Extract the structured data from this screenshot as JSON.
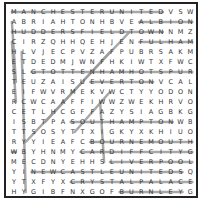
{
  "puzzle": {
    "rows": [
      "MANCHESTERUNITEDVSW",
      "ABRIAHTONHBVEALBION",
      "HUDDERSFIELDTOWNNMZ",
      "CIRZQHHQEHJENFULHAM",
      "HLVJECPVZAFPUBRSAKM",
      "ETDEDMJWNFHKIWTXFWC",
      "SLGTOTTENHAMHOTSPUR",
      "TEUZAISUEVERTONVCAL",
      "EIFWVRMEKVWCTYYODON",
      "RCWCAAFFIWWZWEKHRVO",
      "CETLHCGFFAZYSIAGBKG",
      "ISBTPASOUTHAMPTONWB",
      "TTSOSYTTXIGKYXKHIUO",
      "RYYIEAFCBOURNEMOUTH",
      "WBYHNMYCARDIFFCITYG",
      "MECDNYEHHSLIVERPOOL",
      "YINEWCASTLEUNITEDSQ",
      "YTXFYXCRYSTALPALACE",
      "HYGIBFNXGOFBURNLEYG"
    ],
    "found_words": [
      {
        "word": "MANCHESTER UNITED",
        "r1": 0,
        "c1": 0,
        "r2": 0,
        "c2": 15
      },
      {
        "word": "ALBION",
        "r1": 1,
        "c1": 13,
        "r2": 1,
        "c2": 18
      },
      {
        "word": "HUDDERSFIELD TOWN",
        "r1": 2,
        "c1": 0,
        "r2": 2,
        "c2": 15
      },
      {
        "word": "FULHAM",
        "r1": 3,
        "c1": 13,
        "r2": 3,
        "c2": 18
      },
      {
        "word": "TOTTENHAM HOTSPUR",
        "r1": 6,
        "c1": 2,
        "r2": 6,
        "c2": 18
      },
      {
        "word": "EVERTON",
        "r1": 7,
        "c1": 8,
        "r2": 7,
        "c2": 14
      },
      {
        "word": "SOUTHAMPTON",
        "r1": 11,
        "c1": 6,
        "r2": 11,
        "c2": 16
      },
      {
        "word": "BOURNEMOUTH",
        "r1": 13,
        "c1": 8,
        "r2": 13,
        "c2": 18
      },
      {
        "word": "CARDIFF CITY",
        "r1": 14,
        "c1": 7,
        "r2": 14,
        "c2": 18
      },
      {
        "word": "LIVERPOOL",
        "r1": 15,
        "c1": 10,
        "r2": 15,
        "c2": 18
      },
      {
        "word": "NEWCASTLE UNITED",
        "r1": 16,
        "c1": 2,
        "r2": 16,
        "c2": 17
      },
      {
        "word": "CRYSTAL PALACE",
        "r1": 17,
        "c1": 6,
        "r2": 17,
        "c2": 18
      },
      {
        "word": "BURNLEY",
        "r1": 18,
        "c1": 11,
        "r2": 18,
        "c2": 17
      },
      {
        "word": "ARSENAL",
        "r1": 1,
        "c1": 0,
        "r2": 7,
        "c2": 0
      },
      {
        "word": "CHELSEA",
        "r1": 3,
        "c1": 0,
        "r2": 9,
        "c2": 0
      },
      {
        "word": "WATFORD",
        "r1": 9,
        "c1": 9,
        "r2": 15,
        "c2": 9
      },
      {
        "word": "LEICESTER CITY",
        "r1": 4,
        "c1": 1,
        "r2": 18,
        "c2": 1
      },
      {
        "word": "WOLVES",
        "r1": 14,
        "c1": 0,
        "r2": 14,
        "c2": 0
      },
      {
        "word": "DIAGONAL-1",
        "r1": 2,
        "c1": 12,
        "r2": 13,
        "c2": 1
      },
      {
        "word": "DIAGONAL-2",
        "r1": 4,
        "c1": 10,
        "r2": 11,
        "c2": 3
      },
      {
        "word": "DIAGONAL-3",
        "r1": 8,
        "c1": 10,
        "r2": 12,
        "c2": 6
      }
    ],
    "line_color": "#9a9a9a",
    "letter_color": "#333333"
  }
}
